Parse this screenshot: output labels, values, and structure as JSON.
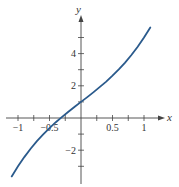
{
  "chart_data": {
    "type": "line",
    "title": "",
    "xlabel": "x",
    "ylabel": "y",
    "xlim": [
      -1.1,
      1.1
    ],
    "ylim": [
      -3.6,
      5.7
    ],
    "grid": false,
    "legend": null,
    "x_ticks": [
      -1,
      -0.75,
      -0.5,
      -0.25,
      0.25,
      0.5,
      0.75,
      1
    ],
    "x_tick_labels": [
      {
        "value": -1,
        "label": "−1"
      },
      {
        "value": -0.5,
        "label": "−0.5"
      },
      {
        "value": 0.5,
        "label": "0.5"
      },
      {
        "value": 1,
        "label": "1"
      }
    ],
    "y_ticks": [
      -3,
      -2,
      -1,
      1,
      2,
      3,
      4,
      5
    ],
    "y_tick_labels": [
      {
        "value": -2,
        "label": "−2"
      },
      {
        "value": 2,
        "label": "2"
      },
      {
        "value": 4,
        "label": "4"
      }
    ],
    "series": [
      {
        "name": "curve",
        "color": "#2a5a8c",
        "x": [
          -1.1,
          -1.0,
          -0.9,
          -0.8,
          -0.7,
          -0.6,
          -0.5,
          -0.4,
          -0.3,
          -0.2,
          -0.1,
          0.0,
          0.1,
          0.2,
          0.3,
          0.4,
          0.5,
          0.6,
          0.7,
          0.8,
          0.9,
          1.0,
          1.1
        ],
        "y": [
          -3.63,
          -3.0,
          -2.43,
          -1.91,
          -1.44,
          -1.02,
          -0.63,
          -0.26,
          0.07,
          0.39,
          0.7,
          1.0,
          1.3,
          1.61,
          1.93,
          2.26,
          2.63,
          3.02,
          3.44,
          3.91,
          4.43,
          5.0,
          5.63
        ]
      }
    ]
  }
}
